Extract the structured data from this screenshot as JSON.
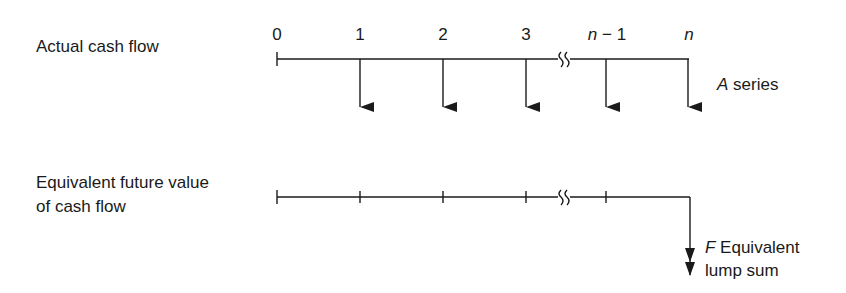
{
  "actual": {
    "label": "Actual cash flow",
    "periods": [
      "0",
      "1",
      "2",
      "3",
      "n − 1",
      "n"
    ],
    "period_n_minus_1": {
      "var": "n",
      "rest": " − 1"
    },
    "period_n": "n",
    "series_label": {
      "var": "A",
      "rest": " series"
    }
  },
  "equivalent": {
    "label_line1": "Equivalent future value",
    "label_line2": "of cash flow",
    "lump_label_line1": {
      "var": "F",
      "rest": " Equivalent"
    },
    "lump_label_line2": "lump sum"
  },
  "colors": {
    "line": "#1a1a1a",
    "background": "#ffffff"
  }
}
